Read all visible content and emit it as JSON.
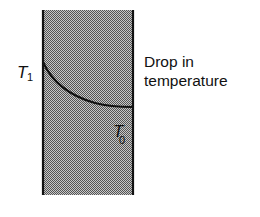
{
  "diagram": {
    "labels": {
      "t1": {
        "main": "T",
        "sub": "1"
      },
      "t0": {
        "main": "T",
        "sub": "0"
      }
    },
    "caption": {
      "line1": "Drop in",
      "line2": "temperature"
    },
    "colors": {
      "slab_fill": "#8a8a8a",
      "slab_border": "#111111",
      "curve": "#111111"
    }
  }
}
